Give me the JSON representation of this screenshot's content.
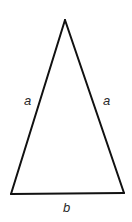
{
  "diagram": {
    "type": "isosceles-triangle",
    "vertices": {
      "apex": [
        65,
        20
      ],
      "bottom_left": [
        11,
        194
      ],
      "bottom_right": [
        124,
        193
      ]
    },
    "stroke_color": "#111111",
    "stroke_width": 2,
    "labels": {
      "left_side": "a",
      "right_side": "a",
      "base": "b"
    }
  }
}
